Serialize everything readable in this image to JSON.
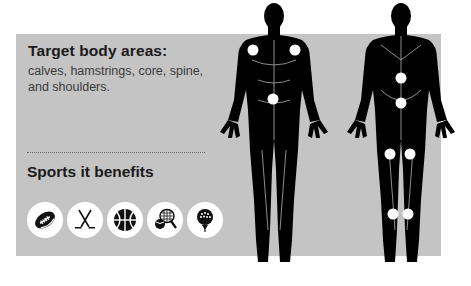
{
  "target": {
    "title": "Target body areas:",
    "description": "calves, hamstrings, core, spine, and shoulders."
  },
  "sports": {
    "title": "Sports it benefits",
    "items": [
      {
        "name": "American football",
        "icon": "football-icon"
      },
      {
        "name": "Hockey",
        "icon": "hockey-sticks-icon"
      },
      {
        "name": "Basketball",
        "icon": "basketball-icon"
      },
      {
        "name": "Tennis",
        "icon": "tennis-racket-icon"
      },
      {
        "name": "Golf",
        "icon": "golf-ball-icon"
      }
    ]
  },
  "figures": {
    "front": {
      "label": "front-view",
      "markers": [
        "left-shoulder",
        "right-shoulder",
        "core"
      ]
    },
    "back": {
      "label": "back-view",
      "markers": [
        "upper-spine",
        "lower-spine",
        "left-hamstring",
        "right-hamstring",
        "left-calf",
        "right-calf"
      ]
    }
  },
  "colors": {
    "panel": "#c4c4c4",
    "figure": "#000000",
    "marker": "#ffffff",
    "icon_bg": "#ffffff"
  }
}
